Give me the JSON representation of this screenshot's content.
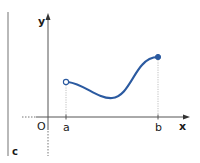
{
  "diagram": {
    "labels": {
      "y_axis": "y",
      "x_axis": "x",
      "origin": "O",
      "a": "a",
      "b": "b",
      "corner": "c"
    },
    "colors": {
      "curve": "#2b5aa0",
      "axis": "#555555",
      "guide": "#b0b0b0",
      "text": "#1a1a1a"
    },
    "points": {
      "start": {
        "label": "a",
        "type": "open"
      },
      "end": {
        "label": "b",
        "type": "closed"
      }
    }
  }
}
